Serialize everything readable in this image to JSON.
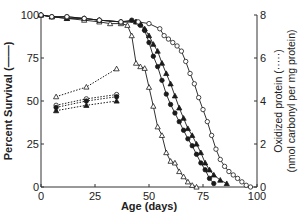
{
  "chart_data": {
    "type": "line",
    "title": "",
    "xlabel": "Age (days)",
    "ylabel_left": "Percent Survival (——)",
    "ylabel_right": "Oxidized protein (·····)",
    "ylabel_right_sub": "(nmol carbonyl per mg protein)",
    "xlim": [
      0,
      100
    ],
    "ylim_left": [
      0,
      100
    ],
    "ylim_right": [
      0,
      8
    ],
    "x_ticks": [
      0,
      25,
      50,
      75,
      100
    ],
    "y_ticks_left": [
      0,
      25,
      50,
      75,
      100
    ],
    "y_ticks_right": [
      0,
      2,
      4,
      6,
      8
    ],
    "grid": false,
    "legend": "none",
    "survival_series": [
      {
        "name": "open-triangle",
        "marker": "triangle-open",
        "x": [
          0,
          5,
          12,
          20,
          27,
          32,
          37,
          40,
          42,
          44,
          46,
          48,
          50,
          52,
          54,
          56,
          58,
          60,
          62,
          64,
          66,
          68,
          70,
          72
        ],
        "y": [
          100,
          99,
          98,
          97,
          96,
          95,
          95,
          94,
          88,
          72,
          70,
          69,
          58,
          47,
          35,
          30,
          20,
          15,
          14,
          9,
          6,
          3,
          1,
          0
        ]
      },
      {
        "name": "filled-circle",
        "marker": "circle-filled",
        "x": [
          0,
          5,
          12,
          20,
          27,
          37,
          42,
          44,
          46,
          48,
          50,
          52,
          54,
          56,
          58,
          60,
          62,
          64,
          66,
          68,
          70,
          72,
          74,
          76,
          78,
          80
        ],
        "y": [
          100,
          99,
          99,
          98,
          97,
          96,
          97,
          96,
          94,
          91,
          84,
          76,
          70,
          62,
          54,
          48,
          43,
          38,
          33,
          28,
          24,
          19,
          14,
          10,
          5,
          2
        ]
      },
      {
        "name": "filled-triangle",
        "marker": "triangle-filled",
        "x": [
          0,
          5,
          12,
          20,
          27,
          37,
          44,
          46,
          48,
          50,
          52,
          54,
          56,
          58,
          60,
          62,
          64,
          66,
          68,
          70,
          72,
          74,
          76,
          78,
          80,
          83,
          86
        ],
        "y": [
          100,
          99,
          98,
          98,
          97,
          96,
          96,
          95,
          92,
          88,
          83,
          79,
          72,
          66,
          60,
          53,
          46,
          40,
          34,
          30,
          25,
          20,
          14,
          10,
          7,
          4,
          2
        ]
      },
      {
        "name": "open-circle",
        "marker": "circle-open",
        "x": [
          0,
          5,
          12,
          20,
          27,
          37,
          45,
          50,
          55,
          57,
          59,
          61,
          63,
          65,
          67,
          69,
          71,
          73,
          75,
          77,
          79,
          81,
          83,
          85,
          87,
          89,
          91,
          93,
          95,
          97
        ],
        "y": [
          100,
          99,
          99,
          98,
          97,
          96,
          96,
          95,
          92,
          88,
          86,
          84,
          82,
          79,
          73,
          66,
          60,
          52,
          45,
          38,
          30,
          22,
          16,
          12,
          9,
          7,
          5,
          3,
          1,
          0
        ]
      }
    ],
    "oxidized_series": [
      {
        "name": "open-triangle",
        "marker": "triangle-open",
        "x": [
          7,
          21,
          35
        ],
        "y": [
          4.2,
          4.65,
          5.5
        ]
      },
      {
        "name": "open-circle",
        "marker": "circle-open",
        "x": [
          7,
          21,
          35
        ],
        "y": [
          3.8,
          4.1,
          4.3
        ]
      },
      {
        "name": "filled-circle",
        "marker": "circle-filled",
        "x": [
          7,
          21,
          35
        ],
        "y": [
          3.7,
          4.0,
          4.2
        ]
      },
      {
        "name": "filled-triangle",
        "marker": "triangle-filled",
        "x": [
          7,
          21,
          35
        ],
        "y": [
          3.55,
          3.8,
          4.0
        ]
      }
    ],
    "colors": {
      "line": "#1a1a1a",
      "axis": "#333333",
      "background": "#ffffff"
    }
  }
}
